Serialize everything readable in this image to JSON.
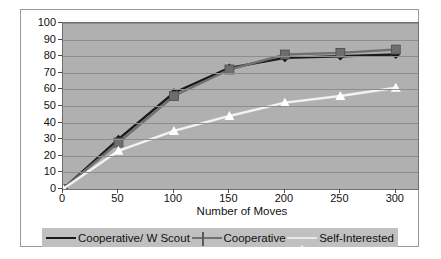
{
  "chart_data": {
    "type": "line",
    "title": "",
    "xlabel": "Number of Moves",
    "ylabel": "% Samples Collected",
    "x": [
      0,
      50,
      100,
      150,
      200,
      250,
      300
    ],
    "xlim": [
      0,
      320
    ],
    "ylim": [
      0,
      100
    ],
    "xticks": [
      "0",
      "50",
      "100",
      "150",
      "200",
      "250",
      "300"
    ],
    "yticks": [
      "0",
      "10",
      "20",
      "30",
      "40",
      "50",
      "60",
      "70",
      "80",
      "90",
      "100"
    ],
    "grid": "horizontal",
    "legend_position": "bottom",
    "plot_background": "#b0b0b0",
    "series": [
      {
        "name": "Cooperative/ W Scout",
        "marker": "diamond",
        "color": "#1a1a1a",
        "values": [
          0,
          30,
          58,
          73,
          79,
          80,
          81
        ]
      },
      {
        "name": "Cooperative",
        "marker": "square",
        "color": "#707070",
        "values": [
          0,
          28,
          56,
          72,
          81,
          82,
          84
        ]
      },
      {
        "name": "Self-Interested",
        "marker": "triangle",
        "color": "#ffffff",
        "values": [
          0,
          23,
          35,
          44,
          52,
          56,
          61
        ]
      }
    ]
  },
  "legend": {
    "items": [
      {
        "label": "Cooperative/ W Scout",
        "marker": "diamond-marker"
      },
      {
        "label": "Cooperative",
        "marker": "square-marker"
      },
      {
        "label": "Self-Interested",
        "marker": "triangle-marker"
      }
    ]
  },
  "axes": {
    "x_title": "Number of Moves",
    "y_title": "% Samples Collected"
  }
}
